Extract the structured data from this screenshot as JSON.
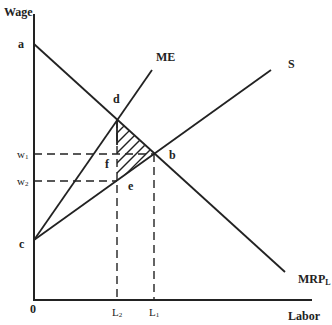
{
  "diagram": {
    "type": "monopsony labor market",
    "axes": {
      "y_label": "Wage",
      "x_label": "Labor",
      "origin_label": "0"
    },
    "curves": [
      {
        "id": "mrp",
        "label": "MRP",
        "label_sub": "L",
        "description": "Marginal revenue product of labor (demand), downward sloping from a"
      },
      {
        "id": "me",
        "label": "ME",
        "description": "Marginal expenditure, steep upward from c"
      },
      {
        "id": "s",
        "label": "S",
        "description": "Labor supply, upward from c"
      }
    ],
    "points": {
      "a": "a",
      "b": "b",
      "c": "c",
      "d": "d",
      "e": "e",
      "f": "f"
    },
    "y_ticks": [
      {
        "label": "w",
        "sub": "1"
      },
      {
        "label": "w",
        "sub": "2"
      }
    ],
    "x_ticks": [
      {
        "label": "L",
        "sub": "2"
      },
      {
        "label": "L",
        "sub": "1"
      }
    ],
    "shaded_region": "triangle d-b-e (deadweight loss), hatched"
  }
}
